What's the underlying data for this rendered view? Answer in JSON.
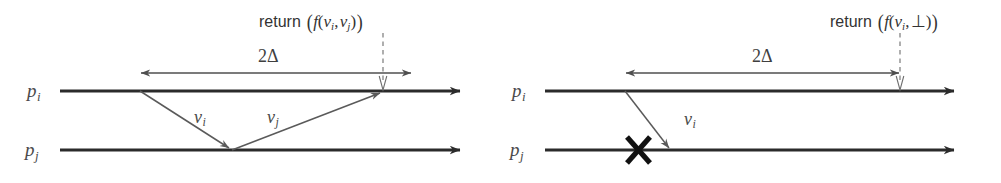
{
  "figure": {
    "type": "sequence-diagram",
    "background_color": "#ffffff",
    "line_color": "#2b2b2b",
    "arrow_color": "#4a4a4a",
    "text_color": "#3c3c3c",
    "panel_count": 2
  },
  "panels": [
    {
      "id": "left",
      "case": "both-values-received",
      "processes": [
        {
          "name": "p_i",
          "base": "p",
          "subscript": "i",
          "y": 91,
          "x_start": 60,
          "x_end": 468
        },
        {
          "name": "p_j",
          "base": "p",
          "subscript": "j",
          "y": 150,
          "x_start": 60,
          "x_end": 468
        }
      ],
      "interval": {
        "label": "2Δ",
        "text_base": "2",
        "text_symbol": "Δ",
        "x_start": 140,
        "x_end": 412,
        "y": 73
      },
      "messages": [
        {
          "name": "v_i",
          "base": "v",
          "subscript": "i",
          "from": {
            "x": 140,
            "y": 91
          },
          "to": {
            "x": 232,
            "y": 150
          },
          "label_x": 196,
          "label_y": 110
        },
        {
          "name": "v_j",
          "base": "v",
          "subscript": "j",
          "from": {
            "x": 232,
            "y": 150
          },
          "to": {
            "x": 383,
            "y": 91
          },
          "label_x": 270,
          "label_y": 110
        }
      ],
      "return_annotation": {
        "keyword": "return",
        "expression": "( f(v_i, v_j) )",
        "function": "f",
        "arguments": [
          "v_i",
          "v_j"
        ],
        "text_x": 262,
        "text_y": 9,
        "dashed_x": 383,
        "dashed_y_start": 32,
        "dashed_y_end": 84
      }
    },
    {
      "id": "right",
      "case": "second-value-missing",
      "processes": [
        {
          "name": "p_i",
          "base": "p",
          "subscript": "i",
          "y": 91,
          "x_start": 545,
          "x_end": 962
        },
        {
          "name": "p_j",
          "base": "p",
          "subscript": "j",
          "y": 150,
          "x_start": 545,
          "x_end": 962
        }
      ],
      "interval": {
        "label": "2Δ",
        "text_base": "2",
        "text_symbol": "Δ",
        "x_start": 625,
        "x_end": 900,
        "y": 73
      },
      "messages": [
        {
          "name": "v_i",
          "base": "v",
          "subscript": "i",
          "from": {
            "x": 625,
            "y": 91
          },
          "to": {
            "x": 672,
            "y": 150
          },
          "label_x": 686,
          "label_y": 112
        }
      ],
      "crash_marker": {
        "name": "crash-cross",
        "glyph": "✕",
        "x": 638,
        "y": 150
      },
      "return_annotation": {
        "keyword": "return",
        "expression": "( f(v_i, ⊥) )",
        "function": "f",
        "arguments": [
          "v_i",
          "⊥"
        ],
        "text_x": 836,
        "text_y": 9,
        "dashed_x": 900,
        "dashed_y_start": 32,
        "dashed_y_end": 84
      }
    }
  ],
  "labels": {
    "process_i": "p",
    "process_j": "p",
    "sub_i": "i",
    "sub_j": "j",
    "delta_number": "2",
    "delta_symbol": "Δ",
    "message_var": "v",
    "return_keyword": "return",
    "function_name": "f",
    "bottom_symbol": "⊥",
    "comma": ",",
    "paren_open": "(",
    "paren_close": ")",
    "big_paren_open": "(",
    "big_paren_close": ")"
  }
}
